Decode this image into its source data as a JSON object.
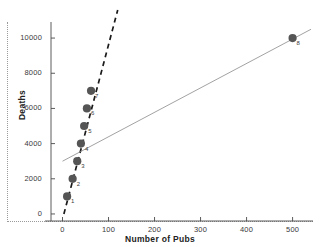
{
  "chart_data": {
    "type": "scatter",
    "title": "",
    "xlabel": "Number of Pubs",
    "ylabel": "Deaths",
    "xlim": [
      -25,
      540
    ],
    "ylim": [
      -400,
      10800
    ],
    "xticks": [
      0,
      100,
      200,
      300,
      400,
      500
    ],
    "yticks": [
      0,
      2000,
      4000,
      6000,
      8000,
      10000
    ],
    "xtick_labels": [
      "0",
      "100",
      "200",
      "300",
      "400",
      "500"
    ],
    "ytick_labels": [
      "0",
      "2000",
      "4000",
      "6000",
      "8000",
      "10000"
    ],
    "grid": false,
    "legend": "none",
    "point_color": "#555555",
    "points": [
      {
        "label": "1",
        "x": 10,
        "y": 1000
      },
      {
        "label": "2",
        "x": 22,
        "y": 2000
      },
      {
        "label": "3",
        "x": 32,
        "y": 3000
      },
      {
        "label": "4",
        "x": 40,
        "y": 4000
      },
      {
        "label": "5",
        "x": 47,
        "y": 5000
      },
      {
        "label": "6",
        "x": 53,
        "y": 6000
      },
      {
        "label": "7",
        "x": 62,
        "y": 7000
      },
      {
        "label": "8",
        "x": 500,
        "y": 10000
      }
    ],
    "series": [
      {
        "name": "fit-without-outlier",
        "style": "dashed",
        "color": "#1a1a1a",
        "x": [
          3,
          120
        ],
        "y": [
          0,
          11600
        ]
      },
      {
        "name": "fit-with-outlier",
        "style": "solid",
        "color": "#8a8a8a",
        "x": [
          0,
          540
        ],
        "y": [
          3000,
          10500
        ]
      }
    ]
  }
}
